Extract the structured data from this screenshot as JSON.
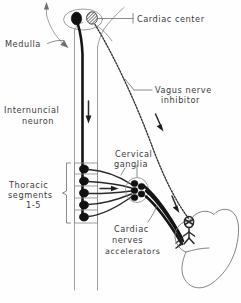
{
  "figure": {
    "background_color": "#fefefe",
    "ink_color": "#2a2a2a",
    "label_color": "#3b3b3b"
  },
  "labels": {
    "cardiac_center": "Cardiac center",
    "medulla": "Medulla",
    "vagus_line1": "Vagus nerve",
    "vagus_line2": "inhibitor",
    "internuncial_line1": "Internuncial",
    "internuncial_line2": "neuron",
    "cervical_line1": "Cervical",
    "cervical_line2": "ganglia",
    "thoracic_line1": "Thoracic",
    "thoracic_line2": "segments",
    "thoracic_line3": "1-5",
    "cardiac_nerves_line1": "Cardiac",
    "cardiac_nerves_line2": "nerves",
    "cardiac_nerves_line3": "accelerators"
  },
  "structures": {
    "spinal_cord": "spinal-cord",
    "medulla_outline": "medulla-outline",
    "heart": "heart-outline",
    "cardiac_center_nuclei": [
      {
        "name": "inhibitor-nucleus",
        "style": "solid"
      },
      {
        "name": "accelerator-nucleus",
        "style": "hatched"
      }
    ],
    "thoracic_segment_count": 5,
    "cervical_ganglia_count": 4,
    "accelerator_fiber_count": 3,
    "flow_arrows": [
      {
        "name": "afferent-arrow-up",
        "direction": "up"
      },
      {
        "name": "internuncial-arrow-down",
        "direction": "down"
      },
      {
        "name": "preganglionic-arrow-right",
        "direction": "right"
      },
      {
        "name": "vagus-efferent-arrow",
        "direction": "down-right"
      },
      {
        "name": "accelerator-efferent-arrow",
        "direction": "down-right"
      }
    ]
  }
}
